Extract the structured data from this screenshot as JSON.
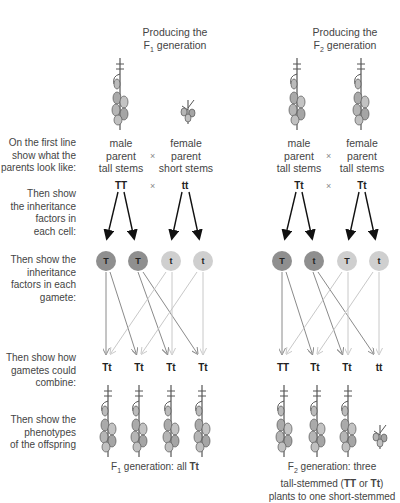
{
  "columns": [
    {
      "title_line1": "Producing the",
      "title_prefix": "F",
      "title_sub": "1",
      "title_suffix": " generation",
      "parents": [
        {
          "line1": "male",
          "line2": "parent",
          "line3": "tall stems"
        },
        {
          "line1": "female",
          "line2": "parent",
          "line3": "short stems"
        }
      ],
      "cross_symbol": "×",
      "parent_genotypes": [
        "TT",
        "tt"
      ],
      "gametes": [
        "T",
        "T",
        "t",
        "t"
      ],
      "offspring_genotypes": [
        "Tt",
        "Tt",
        "Tt",
        "Tt"
      ],
      "caption_prefix": "F",
      "caption_sub": "1",
      "caption_text": " generation: all ",
      "caption_bold": "Tt"
    },
    {
      "title_line1": "Producing the",
      "title_prefix": "F",
      "title_sub": "2",
      "title_suffix": " generation",
      "parents": [
        {
          "line1": "male",
          "line2": "parent",
          "line3": "tall stems"
        },
        {
          "line1": "female",
          "line2": "parent",
          "line3": "tall stems"
        }
      ],
      "cross_symbol": "×",
      "parent_genotypes": [
        "Tt",
        "Tt"
      ],
      "gametes": [
        "T",
        "t",
        "T",
        "t"
      ],
      "offspring_genotypes": [
        "TT",
        "Tt",
        "Tt",
        "tt"
      ],
      "caption_prefix": "F",
      "caption_sub": "2",
      "caption_line1": " generation: three",
      "caption_line2a": "tall-stemmed (",
      "caption_line2b": "TT",
      "caption_line2c": " or ",
      "caption_line2d": "Tt",
      "caption_line2e": ")",
      "caption_line3": "plants to one short-stemmed"
    }
  ],
  "row_labels": {
    "parents": [
      "On the first line",
      "show what the",
      "parents look like:"
    ],
    "factors_cell": [
      "Then show",
      "the inheritance",
      "factors in",
      "each cell:"
    ],
    "factors_gamete": [
      "Then show the",
      "inheritance",
      "factors in each",
      "gamete:"
    ],
    "combine": [
      "Then show how",
      "gametes could",
      "combine:"
    ],
    "phenotypes": [
      "Then show the",
      "phenotypes",
      "of the offspring"
    ]
  },
  "colors": {
    "male_gamete": "#8f8f8f",
    "female_gamete": "#cfcfcf",
    "dark_arrow": "#111111",
    "mid_arrow": "#8a8a8a",
    "light_arrow": "#c8c8c8"
  }
}
